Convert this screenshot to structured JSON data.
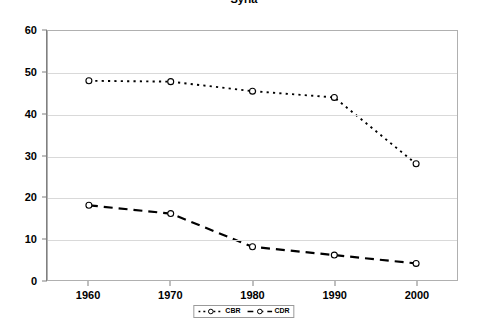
{
  "chart_data": {
    "type": "line",
    "title": "Syria",
    "xlabel": "",
    "ylabel": "",
    "x": [
      1960,
      1970,
      1980,
      1990,
      2000
    ],
    "categories": [
      "1960",
      "1970",
      "1980",
      "1990",
      "2000"
    ],
    "xlim": [
      1955,
      2005
    ],
    "ylim": [
      0,
      60
    ],
    "yticks": [
      0,
      10,
      20,
      30,
      40,
      50,
      60
    ],
    "ytick_labels": [
      "0",
      "10",
      "20",
      "30",
      "40",
      "50",
      "60"
    ],
    "grid": "horizontal",
    "legend_position": "bottom-center",
    "series": [
      {
        "name": "CBR",
        "values": [
          48,
          47.8,
          45.5,
          44,
          28
        ],
        "line_style": "dotted",
        "marker": "circle-open",
        "color": "#000000"
      },
      {
        "name": "CDR",
        "values": [
          18,
          16,
          8,
          6,
          4
        ],
        "line_style": "dashed",
        "marker": "circle-open",
        "color": "#000000"
      }
    ]
  },
  "legend": {
    "entries": [
      {
        "label": "CBR"
      },
      {
        "label": "CDR"
      }
    ]
  },
  "colors": {
    "plot_background": "#ffffff",
    "plot_border": "#b0b0b0",
    "gridline": "#d9d9d9",
    "axis": "#808080",
    "series": "#000000",
    "text": "#000000"
  }
}
